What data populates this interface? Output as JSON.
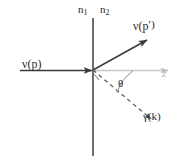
{
  "figure": {
    "background_color": "#ffffff",
    "width": 178,
    "height": 166
  },
  "labels": {
    "medium_left": "n",
    "medium_left_sub": "1",
    "medium_right": "n",
    "medium_right_sub": "2",
    "incoming_neutrino": "ν(p)",
    "outgoing_neutrino": "ν(p",
    "outgoing_neutrino_prime": "′)",
    "photon": "γ(k)",
    "angle": "θ",
    "axis_z": "z"
  },
  "colors": {
    "line_dark": "#3a3a3a",
    "line_interface": "#4a4a4a",
    "axis_light": "#c8c8c8",
    "dashed": "#555555",
    "text": "#2b2b2b",
    "text_light": "#b9b9b9"
  },
  "geometry": {
    "origin_x": 93,
    "origin_y": 70,
    "interface_top_y": 18,
    "interface_bottom_y": 156,
    "incoming_start_x": 20,
    "z_axis_end_x": 172,
    "outgoing_tip_x": 148,
    "outgoing_tip_y": 39,
    "photon_end_x": 152,
    "photon_end_y": 120,
    "theta_degrees": 30
  },
  "elements": [
    {
      "name": "interface-line",
      "type": "solid-vertical"
    },
    {
      "name": "incoming-neutrino-arrow",
      "type": "solid-arrow"
    },
    {
      "name": "outgoing-neutrino-arrow",
      "type": "solid-arrow"
    },
    {
      "name": "z-axis-arrow",
      "type": "light-arrow"
    },
    {
      "name": "photon-dashed-line",
      "type": "dashed-arrow"
    },
    {
      "name": "theta-arc",
      "type": "arc"
    }
  ]
}
